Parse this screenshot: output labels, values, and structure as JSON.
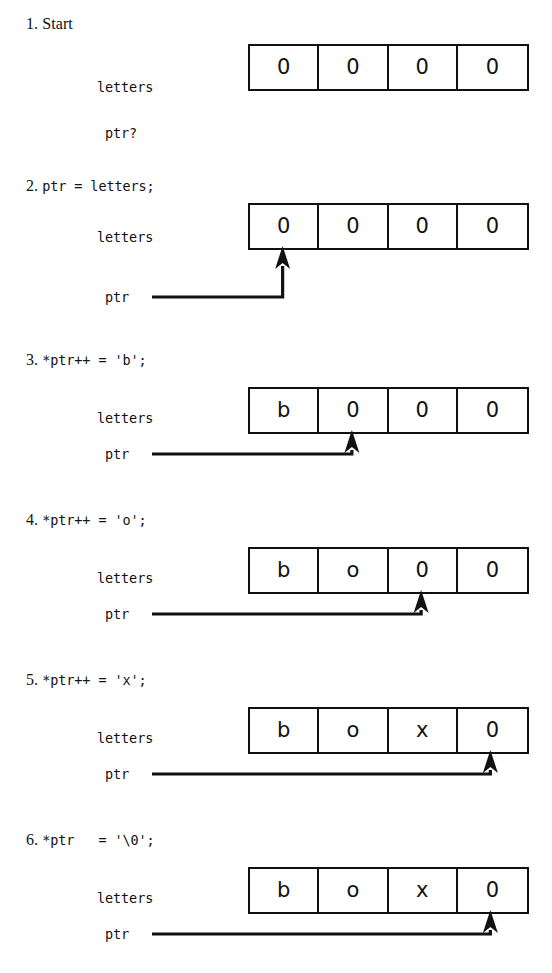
{
  "figure": {
    "ink_color": "#111111",
    "background_color": "#ffffff",
    "array_label": "letters",
    "pointer_label": "ptr",
    "pointer_unknown_label": "ptr?",
    "cell_count": 4
  },
  "steps": [
    {
      "number": "1.",
      "code": "Start",
      "code_is_mono": false,
      "array_label": "letters",
      "cells": [
        "0",
        "0",
        "0",
        "0"
      ],
      "pointer": {
        "visible": false,
        "label": "ptr?",
        "target_cell": null
      }
    },
    {
      "number": "2.",
      "code": "ptr = letters;",
      "code_is_mono": true,
      "array_label": "letters",
      "cells": [
        "0",
        "0",
        "0",
        "0"
      ],
      "pointer": {
        "visible": true,
        "label": "ptr",
        "target_cell": 1
      }
    },
    {
      "number": "3.",
      "code": "*ptr++ = 'b';",
      "code_is_mono": true,
      "array_label": "letters",
      "cells": [
        "b",
        "0",
        "0",
        "0"
      ],
      "pointer": {
        "visible": true,
        "label": "ptr",
        "target_cell": 2
      }
    },
    {
      "number": "4.",
      "code": "*ptr++ = 'o';",
      "code_is_mono": true,
      "array_label": "letters",
      "cells": [
        "b",
        "o",
        "0",
        "0"
      ],
      "pointer": {
        "visible": true,
        "label": "ptr",
        "target_cell": 3
      }
    },
    {
      "number": "5.",
      "code": "*ptr++ = 'x';",
      "code_is_mono": true,
      "array_label": "letters",
      "cells": [
        "b",
        "o",
        "x",
        "0"
      ],
      "pointer": {
        "visible": true,
        "label": "ptr",
        "target_cell": 4
      }
    },
    {
      "number": "6.",
      "code": "*ptr   = '\\0';",
      "code_is_mono": true,
      "array_label": "letters",
      "cells": [
        "b",
        "o",
        "x",
        "0"
      ],
      "pointer": {
        "visible": true,
        "label": "ptr",
        "target_cell": 4
      }
    }
  ]
}
